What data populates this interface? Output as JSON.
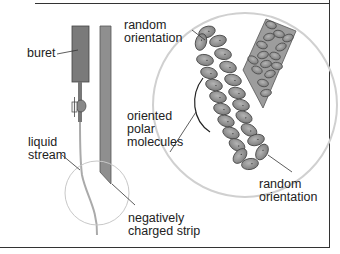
{
  "diagram": {
    "type": "scientific illustration",
    "labels": {
      "buret": "buret",
      "liquid_stream_1": "liquid",
      "liquid_stream_2": "stream",
      "random_top_1": "random",
      "random_top_2": "orientation",
      "oriented_1": "oriented",
      "oriented_2": "polar",
      "oriented_3": "molecules",
      "random_bottom_1": "random",
      "random_bottom_2": "orientation",
      "strip_1": "negatively",
      "strip_2": "charged strip"
    },
    "colors": {
      "buret": "#7a7a7a",
      "strip": "#8f8f8f",
      "molecule": "#9a9a9a",
      "molecule_outline": "#444444",
      "magnifier_circle": "#c8c8c8",
      "frame": "#333333"
    }
  }
}
